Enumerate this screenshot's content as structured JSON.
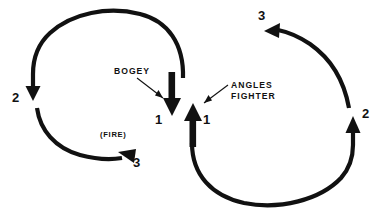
{
  "diagram": {
    "background_color": "#ffffff",
    "ink_color": "#111111",
    "labels": {
      "bogey": "BOGEY",
      "angles_fighter_line1": "ANGLES",
      "angles_fighter_line2": "FIGHTER",
      "fire": "(FIRE)"
    },
    "position_markers": {
      "bogey_pos1": "1",
      "bogey_pos2": "2",
      "bogey_pos3": "3",
      "fighter_pos1": "1",
      "fighter_pos2": "2",
      "fighter_pos3": "3"
    }
  }
}
